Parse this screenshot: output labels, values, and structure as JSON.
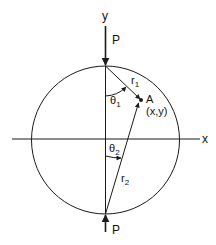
{
  "diagram": {
    "labels": {
      "y_axis": "y",
      "x_axis": "x",
      "load_top": "P",
      "load_bottom": "P",
      "r1": "r",
      "r1_sub": "1",
      "r2": "r",
      "r2_sub": "2",
      "theta1": "θ",
      "theta1_sub": "1",
      "theta2": "θ",
      "theta2_sub": "2",
      "point": "A",
      "point_coords": "(x,y)"
    },
    "colors": {
      "stroke": "#1a1a1a",
      "background": "#ffffff"
    }
  }
}
